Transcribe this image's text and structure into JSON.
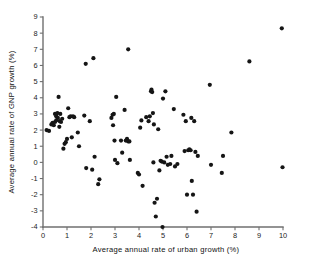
{
  "figure": {
    "background_color": "#ffffff",
    "point_color": "#151515",
    "axis_color": "#6f6f6f",
    "text_color": "#111111"
  },
  "chart_data": {
    "type": "scatter",
    "title": "",
    "xlabel": "Average annual rate of urban growth (%)",
    "ylabel": "Average annual rate of GNP growth (%)",
    "xlim": [
      0,
      10
    ],
    "ylim": [
      -4,
      9
    ],
    "xticks": [
      0,
      1,
      2,
      3,
      4,
      5,
      6,
      7,
      8,
      9,
      10
    ],
    "xtick_labels": [
      "0",
      "1",
      "2",
      "3",
      "4",
      "5",
      "6",
      "7",
      "8",
      "9",
      "10"
    ],
    "yticks": [
      -4,
      -3,
      -2,
      -1,
      0,
      1,
      2,
      3,
      4,
      5,
      6,
      7,
      8,
      9
    ],
    "ytick_labels": [
      "-4",
      "-3",
      "-2",
      "-1",
      "0",
      "1",
      "2",
      "3",
      "4",
      "5",
      "6",
      "7",
      "8",
      "9"
    ],
    "grid": false,
    "legend": null,
    "marker": "filled-circle",
    "marker_size": 2.1,
    "n_points": 112,
    "points": [
      [
        0.15,
        2.0
      ],
      [
        0.25,
        1.95
      ],
      [
        0.35,
        2.35
      ],
      [
        0.4,
        2.45
      ],
      [
        0.45,
        2.3
      ],
      [
        0.5,
        2.5
      ],
      [
        0.5,
        3.0
      ],
      [
        0.55,
        2.85
      ],
      [
        0.55,
        2.6
      ],
      [
        0.6,
        3.05
      ],
      [
        0.62,
        2.75
      ],
      [
        0.65,
        4.05
      ],
      [
        0.68,
        2.2
      ],
      [
        0.7,
        2.55
      ],
      [
        0.72,
        3.0
      ],
      [
        0.75,
        2.5
      ],
      [
        0.8,
        2.7
      ],
      [
        0.85,
        0.85
      ],
      [
        0.9,
        1.15
      ],
      [
        0.95,
        1.25
      ],
      [
        1.0,
        1.45
      ],
      [
        1.05,
        3.35
      ],
      [
        1.1,
        2.8
      ],
      [
        1.15,
        2.85
      ],
      [
        1.2,
        1.55
      ],
      [
        1.25,
        2.85
      ],
      [
        1.3,
        2.8
      ],
      [
        1.45,
        1.85
      ],
      [
        1.5,
        1.0
      ],
      [
        1.72,
        2.9
      ],
      [
        1.78,
        6.1
      ],
      [
        1.8,
        -0.35
      ],
      [
        1.95,
        2.55
      ],
      [
        2.05,
        -0.45
      ],
      [
        2.1,
        6.45
      ],
      [
        2.15,
        0.35
      ],
      [
        2.3,
        -1.35
      ],
      [
        2.35,
        -1.05
      ],
      [
        2.85,
        2.75
      ],
      [
        2.9,
        2.95
      ],
      [
        2.92,
        2.3
      ],
      [
        2.95,
        3.0
      ],
      [
        2.98,
        1.35
      ],
      [
        3.0,
        0.15
      ],
      [
        3.05,
        4.05
      ],
      [
        3.1,
        -0.05
      ],
      [
        3.25,
        1.35
      ],
      [
        3.3,
        0.6
      ],
      [
        3.4,
        3.25
      ],
      [
        3.45,
        1.35
      ],
      [
        3.5,
        1.45
      ],
      [
        3.55,
        1.3
      ],
      [
        3.55,
        7.0
      ],
      [
        3.6,
        1.3
      ],
      [
        3.62,
        0.15
      ],
      [
        3.95,
        -0.65
      ],
      [
        4.0,
        -0.75
      ],
      [
        4.05,
        2.15
      ],
      [
        4.1,
        2.6
      ],
      [
        4.15,
        -1.45
      ],
      [
        4.3,
        2.8
      ],
      [
        4.4,
        2.55
      ],
      [
        4.45,
        2.85
      ],
      [
        4.5,
        4.4
      ],
      [
        4.52,
        4.5
      ],
      [
        4.55,
        4.35
      ],
      [
        4.58,
        3.05
      ],
      [
        4.6,
        0.0
      ],
      [
        4.62,
        2.35
      ],
      [
        4.65,
        -2.5
      ],
      [
        4.7,
        -3.35
      ],
      [
        4.75,
        -2.25
      ],
      [
        4.8,
        2.05
      ],
      [
        4.85,
        -0.5
      ],
      [
        4.9,
        0.1
      ],
      [
        4.95,
        0.05
      ],
      [
        4.98,
        -4.0
      ],
      [
        5.0,
        3.95
      ],
      [
        5.05,
        0.0
      ],
      [
        5.1,
        4.4
      ],
      [
        5.15,
        0.35
      ],
      [
        5.2,
        -0.15
      ],
      [
        5.3,
        -0.1
      ],
      [
        5.35,
        0.4
      ],
      [
        5.45,
        3.3
      ],
      [
        5.5,
        -0.25
      ],
      [
        5.6,
        -0.1
      ],
      [
        5.85,
        2.95
      ],
      [
        5.9,
        0.7
      ],
      [
        5.95,
        2.55
      ],
      [
        6.0,
        -2.0
      ],
      [
        6.05,
        0.75
      ],
      [
        6.1,
        0.8
      ],
      [
        6.15,
        0.75
      ],
      [
        6.18,
        2.75
      ],
      [
        6.2,
        -1.15
      ],
      [
        6.25,
        -2.0
      ],
      [
        6.3,
        2.55
      ],
      [
        6.35,
        0.65
      ],
      [
        6.4,
        -3.05
      ],
      [
        6.45,
        0.4
      ],
      [
        6.95,
        4.8
      ],
      [
        7.0,
        -0.15
      ],
      [
        7.45,
        -0.65
      ],
      [
        7.5,
        0.4
      ],
      [
        7.85,
        1.85
      ],
      [
        8.6,
        6.25
      ],
      [
        9.95,
        8.3
      ],
      [
        9.98,
        -0.3
      ]
    ]
  }
}
